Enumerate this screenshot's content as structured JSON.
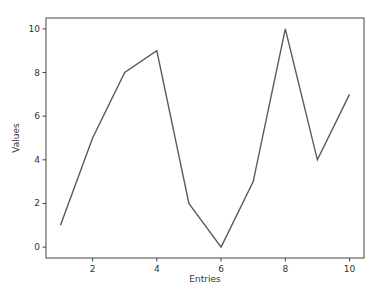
{
  "chart_data": {
    "type": "line",
    "title": "",
    "xlabel": "Entries",
    "ylabel": "Values",
    "x": [
      1,
      2,
      3,
      4,
      5,
      6,
      7,
      8,
      9,
      10
    ],
    "series": [
      {
        "name": "Values",
        "values": [
          1,
          5,
          8,
          9,
          2,
          0,
          3,
          10,
          4,
          7
        ]
      }
    ],
    "xlim": [
      0.55,
      10.45
    ],
    "ylim": [
      -0.5,
      10.5
    ],
    "xticks": [
      2,
      4,
      6,
      8,
      10
    ],
    "yticks": [
      0,
      2,
      4,
      6,
      8,
      10
    ],
    "grid": false,
    "legend": "none",
    "line_color": "#5a5a5a"
  },
  "colors": {
    "line": "#5a5a5a",
    "axes": "#444444",
    "text": "#333333",
    "background": "#ffffff"
  }
}
